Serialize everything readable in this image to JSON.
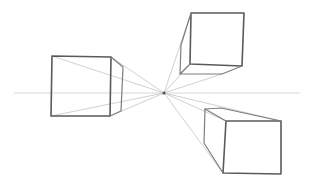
{
  "scene": {
    "subject": "one-point perspective pencil sketch of three boxes",
    "colors": {
      "background": "#ffffff",
      "pencil_dark": "#5a5a5a",
      "pencil_mid": "#7d7d7d",
      "guide": "#c4c4c4",
      "horizon": "#d4d4d4"
    },
    "vanishing_point": [
      164,
      93
    ],
    "horizon_y": 93,
    "boxes": [
      {
        "name": "left-box",
        "front": [
          [
            52,
            56
          ],
          [
            111,
            57
          ],
          [
            110,
            116
          ],
          [
            51,
            116
          ]
        ],
        "back": [
          [
            123,
            67
          ],
          [
            121,
            111
          ]
        ]
      },
      {
        "name": "top-right-box",
        "front": [
          [
            191,
            13
          ],
          [
            244,
            13
          ],
          [
            242,
            66
          ],
          [
            190,
            64
          ]
        ],
        "back": [
          [
            181,
            45
          ],
          [
            180,
            74
          ],
          [
            222,
            74
          ]
        ]
      },
      {
        "name": "bottom-right-box",
        "front": [
          [
            226,
            121
          ],
          [
            281,
            121
          ],
          [
            281,
            174
          ],
          [
            223,
            173
          ]
        ],
        "back": [
          [
            205,
            109
          ],
          [
            221,
            108
          ]
        ]
      }
    ]
  }
}
